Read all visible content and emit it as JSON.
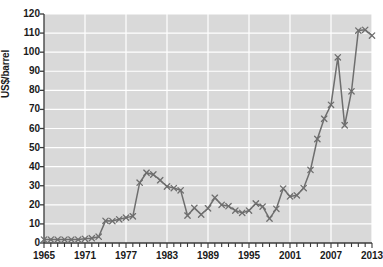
{
  "chart_data": {
    "type": "line",
    "title": "",
    "xlabel": "",
    "ylabel": "US$/barrel",
    "xlim": [
      1965,
      2013
    ],
    "ylim": [
      0,
      120
    ],
    "y_ticks": [
      0,
      10,
      20,
      30,
      40,
      50,
      60,
      70,
      80,
      90,
      100,
      110,
      120
    ],
    "x_ticks_labeled": [
      1965,
      1971,
      1977,
      1983,
      1989,
      1995,
      2001,
      2007,
      2013
    ],
    "x_tick_interval": 1,
    "grid": true,
    "legend": "none",
    "marker": "x",
    "series_color": "#6e6e6e",
    "plot_background": "#d9d9d9",
    "gridline_color": "#ffffff",
    "x": [
      1965,
      1966,
      1967,
      1968,
      1969,
      1970,
      1971,
      1972,
      1973,
      1974,
      1975,
      1976,
      1977,
      1978,
      1979,
      1980,
      1981,
      1982,
      1983,
      1984,
      1985,
      1986,
      1987,
      1988,
      1989,
      1990,
      1991,
      1992,
      1993,
      1994,
      1995,
      1996,
      1997,
      1998,
      1999,
      2000,
      2001,
      2002,
      2003,
      2004,
      2005,
      2006,
      2007,
      2008,
      2009,
      2010,
      2011,
      2012,
      2013
    ],
    "values": [
      1.8,
      1.8,
      1.8,
      1.8,
      1.8,
      1.8,
      2.2,
      2.5,
      3.3,
      11.6,
      11.5,
      12.4,
      13.3,
      14.0,
      31.6,
      36.8,
      35.9,
      32.9,
      29.6,
      28.8,
      27.6,
      14.4,
      18.4,
      14.9,
      18.2,
      23.7,
      20.0,
      19.3,
      17.0,
      15.8,
      17.0,
      20.7,
      19.1,
      12.8,
      17.9,
      28.5,
      24.4,
      25.0,
      28.8,
      38.3,
      54.5,
      65.1,
      72.4,
      97.3,
      61.7,
      79.5,
      111.3,
      111.7,
      108.7
    ]
  }
}
